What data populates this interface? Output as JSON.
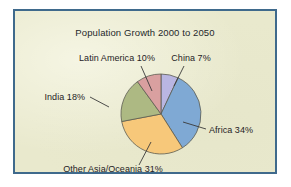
{
  "figure": {
    "background_color": "#ffffff",
    "panel_color": "#e9e9cd",
    "border_color": "#3f6a8c",
    "text_color": "#1f2225"
  },
  "chart_data": {
    "type": "pie",
    "title": "Population Growth 2000 to 2050",
    "xlabel": "",
    "ylabel": "",
    "legend_position": "none",
    "grid": false,
    "units": "percent",
    "total": 100,
    "start_angle_deg": 0,
    "direction": "clockwise",
    "categories": [
      "China",
      "Africa",
      "Other Asia/Oceania",
      "India",
      "Latin America"
    ],
    "values": [
      7,
      34,
      31,
      18,
      10
    ],
    "colors": [
      "#b9b6e2",
      "#7fa9d4",
      "#f7c87a",
      "#adb983",
      "#d9a0a0"
    ],
    "slices": [
      {
        "name": "China",
        "value": 7,
        "label": "China 7%",
        "color": "#b9b6e2",
        "label_x": 178,
        "label_y": 52,
        "label_anchor": "middle",
        "leader": {
          "x1": 171,
          "y1": 57,
          "x2": 161,
          "y2": 77
        }
      },
      {
        "name": "Africa",
        "value": 34,
        "label": "Africa 34%",
        "color": "#7fa9d4",
        "label_x": 196,
        "label_y": 124,
        "label_anchor": "start",
        "leader": {
          "x1": 193,
          "y1": 120,
          "x2": 170,
          "y2": 113
        }
      },
      {
        "name": "Other Asia/Oceania",
        "value": 31,
        "label": "Other Asia/Oceania 31%",
        "color": "#f7c87a",
        "label_x": 100,
        "label_y": 163,
        "label_anchor": "middle",
        "leader": {
          "x1": 126,
          "y1": 156,
          "x2": 138,
          "y2": 133
        }
      },
      {
        "name": "India",
        "value": 18,
        "label": "India 18%",
        "color": "#adb983",
        "label_x": 72,
        "label_y": 91,
        "label_anchor": "end",
        "leader": {
          "x1": 77,
          "y1": 88,
          "x2": 96,
          "y2": 98
        }
      },
      {
        "name": "Latin America",
        "value": 10,
        "label": "Latin America 10%",
        "color": "#d9a0a0",
        "label_x": 104,
        "label_y": 52,
        "label_anchor": "middle",
        "leader": {
          "x1": 128,
          "y1": 57,
          "x2": 139,
          "y2": 82
        }
      }
    ],
    "geometry": {
      "cx": 148,
      "cy": 105,
      "r": 40
    }
  }
}
